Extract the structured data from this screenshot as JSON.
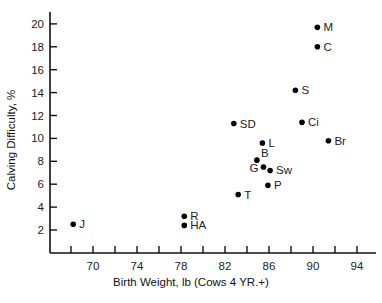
{
  "chart_data": {
    "type": "scatter",
    "title": "",
    "xlabel": "Birth Weight, lb (Cows 4 YR.+)",
    "ylabel": "Calving Difficulty, %",
    "xlim": [
      66.5,
      96
    ],
    "ylim": [
      0,
      21
    ],
    "x_ticks": [
      68,
      70,
      72,
      74,
      76,
      78,
      80,
      82,
      84,
      86,
      88,
      90,
      92,
      94
    ],
    "x_tick_labels": [
      "70",
      "74",
      "78",
      "82",
      "86",
      "90",
      "94"
    ],
    "x_tick_label_values": [
      70,
      74,
      78,
      82,
      86,
      90,
      94
    ],
    "y_ticks": [
      2,
      4,
      6,
      8,
      10,
      12,
      14,
      16,
      18,
      20
    ],
    "y_tick_labels": [
      "2",
      "4",
      "6",
      "8",
      "10",
      "12",
      "14",
      "16",
      "18",
      "20"
    ],
    "grid": false,
    "legend": null,
    "points": [
      {
        "label": "J",
        "x": 68.2,
        "y": 2.5
      },
      {
        "label": "R",
        "x": 78.3,
        "y": 3.2
      },
      {
        "label": "HA",
        "x": 78.3,
        "y": 2.4
      },
      {
        "label": "SD",
        "x": 82.8,
        "y": 11.3
      },
      {
        "label": "T",
        "x": 83.2,
        "y": 5.1
      },
      {
        "label": "B",
        "x": 84.9,
        "y": 8.1
      },
      {
        "label": "L",
        "x": 85.4,
        "y": 9.6
      },
      {
        "label": "G",
        "x": 85.5,
        "y": 7.5
      },
      {
        "label": "P",
        "x": 85.9,
        "y": 5.9
      },
      {
        "label": "Sw",
        "x": 86.1,
        "y": 7.2
      },
      {
        "label": "S",
        "x": 88.4,
        "y": 14.2
      },
      {
        "label": "Ci",
        "x": 89.0,
        "y": 11.4
      },
      {
        "label": "M",
        "x": 90.4,
        "y": 19.7
      },
      {
        "label": "C",
        "x": 90.4,
        "y": 18.0
      },
      {
        "label": "Br",
        "x": 91.4,
        "y": 9.8
      }
    ]
  },
  "label_placement": {
    "J": "right",
    "R": "right",
    "HA": "right",
    "SD": "right",
    "T": "right",
    "B": "upright",
    "L": "right",
    "G": "left",
    "P": "right",
    "Sw": "right",
    "S": "right",
    "Ci": "right",
    "M": "right",
    "C": "right",
    "Br": "right"
  }
}
